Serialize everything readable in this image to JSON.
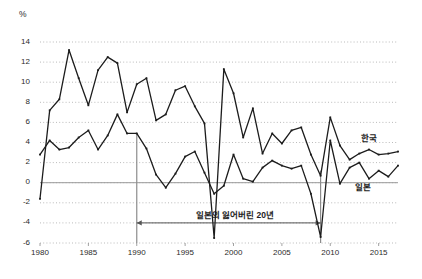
{
  "chart_data": {
    "type": "line",
    "title": "",
    "xlabel": "",
    "ylabel": "%",
    "unit_label": "%",
    "xlim": [
      1980,
      2017
    ],
    "ylim": [
      -6,
      14
    ],
    "grid": true,
    "gridlines_y": [
      -6,
      -4,
      -2,
      0,
      2,
      4,
      6,
      8,
      10,
      12,
      14
    ],
    "ytick_labels": [
      "14",
      "12",
      "10",
      "8",
      "6",
      "4",
      "2",
      "0",
      "-2",
      "-4",
      "-6"
    ],
    "ytick_values": [
      14,
      12,
      10,
      8,
      6,
      4,
      2,
      0,
      -2,
      -4,
      -6
    ],
    "xtick_labels": [
      "1980",
      "1985",
      "1990",
      "1995",
      "2000",
      "2005",
      "2010",
      "2015"
    ],
    "xtick_values": [
      1980,
      1985,
      1990,
      1995,
      2000,
      2005,
      2010,
      2015
    ],
    "x": [
      1980,
      1981,
      1982,
      1983,
      1984,
      1985,
      1986,
      1987,
      1988,
      1989,
      1990,
      1991,
      1992,
      1993,
      1994,
      1995,
      1996,
      1997,
      1998,
      1999,
      2000,
      2001,
      2002,
      2003,
      2004,
      2005,
      2006,
      2007,
      2008,
      2009,
      2010,
      2011,
      2012,
      2013,
      2014,
      2015,
      2016,
      2017
    ],
    "legend_position": "inline-right",
    "series": [
      {
        "name": "한국",
        "color": "#1c1c1c",
        "values": [
          -1.6,
          7.2,
          8.3,
          13.2,
          10.4,
          7.7,
          11.2,
          12.5,
          11.9,
          7.0,
          9.8,
          10.4,
          6.2,
          6.8,
          9.2,
          9.6,
          7.6,
          5.9,
          -5.5,
          11.3,
          8.9,
          4.5,
          7.4,
          2.9,
          4.9,
          3.9,
          5.2,
          5.5,
          2.8,
          0.7,
          6.5,
          3.7,
          2.3,
          2.9,
          3.3,
          2.8,
          2.9,
          3.1
        ]
      },
      {
        "name": "일본",
        "color": "#1c1c1c",
        "values": [
          2.8,
          4.2,
          3.3,
          3.5,
          4.5,
          5.2,
          3.3,
          4.7,
          6.8,
          4.9,
          4.9,
          3.4,
          0.8,
          -0.5,
          0.9,
          2.6,
          3.1,
          1.0,
          -1.1,
          -0.3,
          2.8,
          0.4,
          0.1,
          1.5,
          2.2,
          1.7,
          1.4,
          1.7,
          -1.1,
          -5.4,
          4.2,
          -0.1,
          1.5,
          2.0,
          0.4,
          1.2,
          0.6,
          1.7
        ]
      }
    ],
    "annotations": [
      {
        "name": "lost-decades",
        "text": "일본의 잃어버린 20년",
        "start_x": 1990,
        "end_x": 2009,
        "y": -4,
        "marker_line_x": 1990,
        "color": "#8c8c8c"
      }
    ]
  }
}
